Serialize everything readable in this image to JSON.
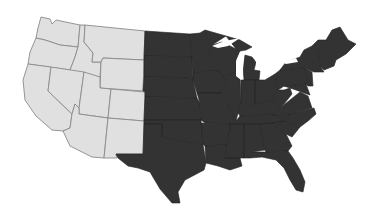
{
  "map": {
    "subject": "United States (contiguous 48 states)",
    "colors": {
      "background": "#ffffff",
      "west_fill": "#e0e0e0",
      "west_border": "#8a8a8a",
      "east_fill": "#333333",
      "east_border": "#222222",
      "water": "#ffffff"
    },
    "regions": [
      {
        "name": "Western states",
        "shade": "light",
        "states": [
          "Washington",
          "Oregon",
          "California",
          "Idaho",
          "Nevada",
          "Montana",
          "Wyoming",
          "Utah",
          "Arizona",
          "Colorado",
          "New Mexico"
        ]
      },
      {
        "name": "Central and eastern states",
        "shade": "dark",
        "states": [
          "North Dakota",
          "South Dakota",
          "Nebraska",
          "Kansas",
          "Oklahoma",
          "Texas",
          "Minnesota",
          "Iowa",
          "Missouri",
          "Arkansas",
          "Louisiana",
          "Wisconsin",
          "Illinois",
          "Michigan",
          "Indiana",
          "Ohio",
          "Kentucky",
          "Tennessee",
          "Mississippi",
          "Alabama",
          "Georgia",
          "Florida",
          "South Carolina",
          "North Carolina",
          "Virginia",
          "West Virginia",
          "Maryland",
          "Delaware",
          "Pennsylvania",
          "New Jersey",
          "New York",
          "Connecticut",
          "Rhode Island",
          "Massachusetts",
          "Vermont",
          "New Hampshire",
          "Maine"
        ]
      }
    ]
  }
}
